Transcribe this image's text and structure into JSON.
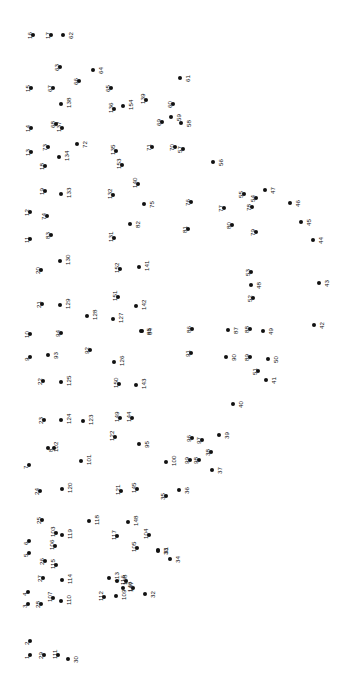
{
  "puzzle": {
    "type": "connect-the-dots",
    "title": "",
    "width": 337,
    "height": 673,
    "dot_color": "#111111",
    "label_color": "#111111",
    "background_color": "#ffffff",
    "label_rotation_deg": -90,
    "dot_count": 154,
    "dots": [
      {
        "n": "1",
        "x": 30,
        "y": 655,
        "lx": -6,
        "ly": 0
      },
      {
        "n": "2",
        "x": 30,
        "y": 641,
        "lx": -6,
        "ly": 0
      },
      {
        "n": "3",
        "x": 28,
        "y": 604,
        "lx": -6,
        "ly": 0
      },
      {
        "n": "4",
        "x": 28,
        "y": 592,
        "lx": -6,
        "ly": 0
      },
      {
        "n": "5",
        "x": 29,
        "y": 553,
        "lx": -6,
        "ly": 0
      },
      {
        "n": "6",
        "x": 29,
        "y": 541,
        "lx": -6,
        "ly": 0
      },
      {
        "n": "7",
        "x": 29,
        "y": 465,
        "lx": -6,
        "ly": 0
      },
      {
        "n": "8",
        "x": 54,
        "y": 448,
        "lx": -6,
        "ly": 0
      },
      {
        "n": "9",
        "x": 30,
        "y": 357,
        "lx": -6,
        "ly": 0
      },
      {
        "n": "10",
        "x": 30,
        "y": 334,
        "lx": -6,
        "ly": 0
      },
      {
        "n": "11",
        "x": 30,
        "y": 239,
        "lx": -6,
        "ly": 0
      },
      {
        "n": "12",
        "x": 30,
        "y": 212,
        "lx": -6,
        "ly": 0
      },
      {
        "n": "13",
        "x": 31,
        "y": 152,
        "lx": -6,
        "ly": 0
      },
      {
        "n": "14",
        "x": 31,
        "y": 128,
        "lx": -6,
        "ly": 0
      },
      {
        "n": "15",
        "x": 31,
        "y": 88,
        "lx": -6,
        "ly": 0
      },
      {
        "n": "16",
        "x": 33,
        "y": 35,
        "lx": -6,
        "ly": 0
      },
      {
        "n": "17",
        "x": 51,
        "y": 35,
        "lx": -6,
        "ly": 0
      },
      {
        "n": "18",
        "x": 45,
        "y": 166,
        "lx": -6,
        "ly": 0
      },
      {
        "n": "19",
        "x": 45,
        "y": 191,
        "lx": -6,
        "ly": 0
      },
      {
        "n": "20",
        "x": 41,
        "y": 270,
        "lx": -6,
        "ly": 0
      },
      {
        "n": "21",
        "x": 42,
        "y": 304,
        "lx": -6,
        "ly": 0
      },
      {
        "n": "22",
        "x": 43,
        "y": 381,
        "lx": -6,
        "ly": 0
      },
      {
        "n": "23",
        "x": 44,
        "y": 420,
        "lx": -6,
        "ly": 0
      },
      {
        "n": "24",
        "x": 40,
        "y": 491,
        "lx": -6,
        "ly": 0
      },
      {
        "n": "25",
        "x": 42,
        "y": 520,
        "lx": -6,
        "ly": 0
      },
      {
        "n": "26",
        "x": 45,
        "y": 561,
        "lx": -6,
        "ly": 0
      },
      {
        "n": "27",
        "x": 43,
        "y": 578,
        "lx": -6,
        "ly": 0
      },
      {
        "n": "28",
        "x": 41,
        "y": 604,
        "lx": -6,
        "ly": 0
      },
      {
        "n": "29",
        "x": 44,
        "y": 655,
        "lx": -6,
        "ly": 0
      },
      {
        "n": "30",
        "x": 68,
        "y": 659,
        "lx": 5,
        "ly": 0
      },
      {
        "n": "31",
        "x": 158,
        "y": 550,
        "lx": 5,
        "ly": 0
      },
      {
        "n": "32",
        "x": 145,
        "y": 594,
        "lx": 5,
        "ly": 0
      },
      {
        "n": "33",
        "x": 158,
        "y": 551,
        "lx": 5,
        "ly": 0
      },
      {
        "n": "34",
        "x": 170,
        "y": 559,
        "lx": 5,
        "ly": 0
      },
      {
        "n": "35",
        "x": 166,
        "y": 496,
        "lx": -6,
        "ly": 0
      },
      {
        "n": "36",
        "x": 179,
        "y": 490,
        "lx": 5,
        "ly": 0
      },
      {
        "n": "37",
        "x": 212,
        "y": 470,
        "lx": 5,
        "ly": 0
      },
      {
        "n": "38",
        "x": 211,
        "y": 452,
        "lx": -6,
        "ly": 0
      },
      {
        "n": "39",
        "x": 219,
        "y": 435,
        "lx": 5,
        "ly": 0
      },
      {
        "n": "40",
        "x": 233,
        "y": 404,
        "lx": 5,
        "ly": 0
      },
      {
        "n": "41",
        "x": 266,
        "y": 380,
        "lx": 5,
        "ly": 0
      },
      {
        "n": "42",
        "x": 314,
        "y": 325,
        "lx": 5,
        "ly": 0
      },
      {
        "n": "43",
        "x": 319,
        "y": 283,
        "lx": 5,
        "ly": 0
      },
      {
        "n": "44",
        "x": 313,
        "y": 240,
        "lx": 5,
        "ly": 0
      },
      {
        "n": "45",
        "x": 301,
        "y": 222,
        "lx": 5,
        "ly": 0
      },
      {
        "n": "46",
        "x": 290,
        "y": 203,
        "lx": 5,
        "ly": 0
      },
      {
        "n": "47",
        "x": 265,
        "y": 190,
        "lx": 5,
        "ly": 0
      },
      {
        "n": "48",
        "x": 251,
        "y": 285,
        "lx": 5,
        "ly": 0
      },
      {
        "n": "49",
        "x": 263,
        "y": 331,
        "lx": 5,
        "ly": 0
      },
      {
        "n": "50",
        "x": 268,
        "y": 359,
        "lx": 5,
        "ly": 0
      },
      {
        "n": "51",
        "x": 258,
        "y": 371,
        "lx": -6,
        "ly": 0
      },
      {
        "n": "52",
        "x": 253,
        "y": 298,
        "lx": -6,
        "ly": 0
      },
      {
        "n": "53",
        "x": 251,
        "y": 272,
        "lx": -6,
        "ly": 0
      },
      {
        "n": "54",
        "x": 256,
        "y": 198,
        "lx": -6,
        "ly": 0
      },
      {
        "n": "55",
        "x": 244,
        "y": 194,
        "lx": -6,
        "ly": 0
      },
      {
        "n": "56",
        "x": 213,
        "y": 162,
        "lx": 5,
        "ly": 0
      },
      {
        "n": "57",
        "x": 183,
        "y": 149,
        "lx": -6,
        "ly": 0
      },
      {
        "n": "58",
        "x": 181,
        "y": 123,
        "lx": 5,
        "ly": 0
      },
      {
        "n": "59",
        "x": 171,
        "y": 117,
        "lx": 5,
        "ly": 0
      },
      {
        "n": "60",
        "x": 173,
        "y": 104,
        "lx": -6,
        "ly": 0
      },
      {
        "n": "61",
        "x": 180,
        "y": 78,
        "lx": 5,
        "ly": 0
      },
      {
        "n": "62",
        "x": 63,
        "y": 35,
        "lx": 5,
        "ly": 0
      },
      {
        "n": "63",
        "x": 60,
        "y": 67,
        "lx": -6,
        "ly": 0
      },
      {
        "n": "64",
        "x": 93,
        "y": 70,
        "lx": 5,
        "ly": 0
      },
      {
        "n": "65",
        "x": 111,
        "y": 88,
        "lx": -6,
        "ly": 0
      },
      {
        "n": "66",
        "x": 79,
        "y": 81,
        "lx": -6,
        "ly": 0
      },
      {
        "n": "67",
        "x": 53,
        "y": 88,
        "lx": -6,
        "ly": 0
      },
      {
        "n": "68",
        "x": 56,
        "y": 124,
        "lx": -6,
        "ly": 0
      },
      {
        "n": "69",
        "x": 162,
        "y": 122,
        "lx": -6,
        "ly": 0
      },
      {
        "n": "70",
        "x": 175,
        "y": 147,
        "lx": -6,
        "ly": 0
      },
      {
        "n": "71",
        "x": 152,
        "y": 147,
        "lx": -6,
        "ly": 0
      },
      {
        "n": "72",
        "x": 77,
        "y": 144,
        "lx": 5,
        "ly": 0
      },
      {
        "n": "73",
        "x": 48,
        "y": 147,
        "lx": -6,
        "ly": 0
      },
      {
        "n": "74",
        "x": 47,
        "y": 216,
        "lx": -6,
        "ly": 0
      },
      {
        "n": "75",
        "x": 144,
        "y": 204,
        "lx": 5,
        "ly": 0
      },
      {
        "n": "76",
        "x": 191,
        "y": 202,
        "lx": -6,
        "ly": 0
      },
      {
        "n": "77",
        "x": 224,
        "y": 208,
        "lx": -6,
        "ly": 0
      },
      {
        "n": "78",
        "x": 252,
        "y": 207,
        "lx": -6,
        "ly": 0
      },
      {
        "n": "79",
        "x": 256,
        "y": 232,
        "lx": -6,
        "ly": 0
      },
      {
        "n": "80",
        "x": 232,
        "y": 225,
        "lx": -6,
        "ly": 0
      },
      {
        "n": "81",
        "x": 188,
        "y": 229,
        "lx": -6,
        "ly": 0
      },
      {
        "n": "82",
        "x": 130,
        "y": 224,
        "lx": 5,
        "ly": 0
      },
      {
        "n": "83",
        "x": 51,
        "y": 235,
        "lx": -6,
        "ly": 0
      },
      {
        "n": "84",
        "x": 142,
        "y": 331,
        "lx": 5,
        "ly": 0
      },
      {
        "n": "85",
        "x": 141,
        "y": 331,
        "lx": 5,
        "ly": 0
      },
      {
        "n": "86",
        "x": 192,
        "y": 329,
        "lx": -6,
        "ly": 0
      },
      {
        "n": "87",
        "x": 228,
        "y": 330,
        "lx": 5,
        "ly": 0
      },
      {
        "n": "88",
        "x": 250,
        "y": 329,
        "lx": -6,
        "ly": 0
      },
      {
        "n": "89",
        "x": 250,
        "y": 357,
        "lx": -6,
        "ly": 0
      },
      {
        "n": "90",
        "x": 226,
        "y": 357,
        "lx": 5,
        "ly": 0
      },
      {
        "n": "91",
        "x": 191,
        "y": 353,
        "lx": -6,
        "ly": 0
      },
      {
        "n": "92",
        "x": 90,
        "y": 350,
        "lx": -6,
        "ly": 0
      },
      {
        "n": "93",
        "x": 48,
        "y": 355,
        "lx": 5,
        "ly": 0
      },
      {
        "n": "94",
        "x": 61,
        "y": 333,
        "lx": -6,
        "ly": 0
      },
      {
        "n": "95",
        "x": 139,
        "y": 444,
        "lx": 5,
        "ly": 0
      },
      {
        "n": "96",
        "x": 192,
        "y": 438,
        "lx": -6,
        "ly": 0
      },
      {
        "n": "97",
        "x": 202,
        "y": 440,
        "lx": -6,
        "ly": 0
      },
      {
        "n": "98",
        "x": 199,
        "y": 460,
        "lx": -6,
        "ly": 0
      },
      {
        "n": "99",
        "x": 190,
        "y": 460,
        "lx": -6,
        "ly": 0
      },
      {
        "n": "100",
        "x": 166,
        "y": 462,
        "lx": 5,
        "ly": 0
      },
      {
        "n": "101",
        "x": 81,
        "y": 461,
        "lx": 5,
        "ly": 0
      },
      {
        "n": "102",
        "x": 48,
        "y": 448,
        "lx": 5,
        "ly": 0
      },
      {
        "n": "103",
        "x": 56,
        "y": 533,
        "lx": -6,
        "ly": 0
      },
      {
        "n": "104",
        "x": 149,
        "y": 535,
        "lx": -6,
        "ly": 0
      },
      {
        "n": "105",
        "x": 137,
        "y": 548,
        "lx": -6,
        "ly": 0
      },
      {
        "n": "106",
        "x": 55,
        "y": 546,
        "lx": -6,
        "ly": 0
      },
      {
        "n": "107",
        "x": 53,
        "y": 598,
        "lx": -6,
        "ly": 0
      },
      {
        "n": "108",
        "x": 117,
        "y": 581,
        "lx": 5,
        "ly": 0
      },
      {
        "n": "109",
        "x": 116,
        "y": 596,
        "lx": 5,
        "ly": 0
      },
      {
        "n": "110",
        "x": 61,
        "y": 601,
        "lx": 5,
        "ly": 0
      },
      {
        "n": "111",
        "x": 58,
        "y": 655,
        "lx": -6,
        "ly": 0
      },
      {
        "n": "112",
        "x": 104,
        "y": 597,
        "lx": -6,
        "ly": 0
      },
      {
        "n": "113",
        "x": 109,
        "y": 578,
        "lx": 5,
        "ly": 0
      },
      {
        "n": "114",
        "x": 62,
        "y": 580,
        "lx": 5,
        "ly": 0
      },
      {
        "n": "115",
        "x": 56,
        "y": 565,
        "lx": -6,
        "ly": 0
      },
      {
        "n": "116",
        "x": 126,
        "y": 581,
        "lx": -6,
        "ly": 0
      },
      {
        "n": "117",
        "x": 117,
        "y": 536,
        "lx": -6,
        "ly": 0
      },
      {
        "n": "118",
        "x": 89,
        "y": 521,
        "lx": 5,
        "ly": 0
      },
      {
        "n": "119",
        "x": 62,
        "y": 535,
        "lx": 5,
        "ly": 0
      },
      {
        "n": "120",
        "x": 62,
        "y": 489,
        "lx": 5,
        "ly": 0
      },
      {
        "n": "121",
        "x": 121,
        "y": 491,
        "lx": -6,
        "ly": 0
      },
      {
        "n": "122",
        "x": 115,
        "y": 437,
        "lx": -6,
        "ly": 0
      },
      {
        "n": "123",
        "x": 83,
        "y": 421,
        "lx": 5,
        "ly": 0
      },
      {
        "n": "124",
        "x": 61,
        "y": 420,
        "lx": 5,
        "ly": 0
      },
      {
        "n": "125",
        "x": 61,
        "y": 382,
        "lx": 5,
        "ly": 0
      },
      {
        "n": "126",
        "x": 114,
        "y": 362,
        "lx": 5,
        "ly": 0
      },
      {
        "n": "127",
        "x": 113,
        "y": 319,
        "lx": 5,
        "ly": 0
      },
      {
        "n": "128",
        "x": 87,
        "y": 316,
        "lx": 5,
        "ly": 0
      },
      {
        "n": "129",
        "x": 60,
        "y": 305,
        "lx": 5,
        "ly": 0
      },
      {
        "n": "130",
        "x": 60,
        "y": 261,
        "lx": 5,
        "ly": 0
      },
      {
        "n": "131",
        "x": 114,
        "y": 238,
        "lx": -6,
        "ly": 0
      },
      {
        "n": "132",
        "x": 113,
        "y": 195,
        "lx": -6,
        "ly": 0
      },
      {
        "n": "133",
        "x": 61,
        "y": 194,
        "lx": 5,
        "ly": 0
      },
      {
        "n": "134",
        "x": 59,
        "y": 157,
        "lx": 5,
        "ly": 0
      },
      {
        "n": "135",
        "x": 116,
        "y": 151,
        "lx": -6,
        "ly": 0
      },
      {
        "n": "136",
        "x": 114,
        "y": 109,
        "lx": -6,
        "ly": 0
      },
      {
        "n": "137",
        "x": 62,
        "y": 128,
        "lx": -6,
        "ly": 0
      },
      {
        "n": "138",
        "x": 61,
        "y": 104,
        "lx": 5,
        "ly": 0
      },
      {
        "n": "139",
        "x": 146,
        "y": 100,
        "lx": -6,
        "ly": 0
      },
      {
        "n": "140",
        "x": 138,
        "y": 184,
        "lx": -6,
        "ly": 0
      },
      {
        "n": "141",
        "x": 139,
        "y": 267,
        "lx": 5,
        "ly": 0
      },
      {
        "n": "142",
        "x": 136,
        "y": 306,
        "lx": 5,
        "ly": 0
      },
      {
        "n": "143",
        "x": 136,
        "y": 385,
        "lx": 5,
        "ly": 0
      },
      {
        "n": "144",
        "x": 132,
        "y": 418,
        "lx": -6,
        "ly": 0
      },
      {
        "n": "145",
        "x": 137,
        "y": 489,
        "lx": -6,
        "ly": 0
      },
      {
        "n": "146",
        "x": 133,
        "y": 588,
        "lx": -6,
        "ly": 0
      },
      {
        "n": "147",
        "x": 123,
        "y": 588,
        "lx": 5,
        "ly": 0
      },
      {
        "n": "148",
        "x": 128,
        "y": 522,
        "lx": 5,
        "ly": 0
      },
      {
        "n": "149",
        "x": 120,
        "y": 418,
        "lx": -6,
        "ly": 0
      },
      {
        "n": "150",
        "x": 119,
        "y": 384,
        "lx": -6,
        "ly": 0
      },
      {
        "n": "151",
        "x": 118,
        "y": 297,
        "lx": -6,
        "ly": 0
      },
      {
        "n": "152",
        "x": 120,
        "y": 269,
        "lx": -6,
        "ly": 0
      },
      {
        "n": "153",
        "x": 122,
        "y": 165,
        "lx": -6,
        "ly": 0
      },
      {
        "n": "154",
        "x": 123,
        "y": 106,
        "lx": 5,
        "ly": 0
      }
    ]
  }
}
